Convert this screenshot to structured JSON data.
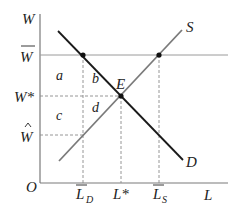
{
  "diagram": {
    "axes": {
      "y_label": "W",
      "x_label": "L",
      "origin_label": "O"
    },
    "y_ticks": [
      {
        "label": "W",
        "overline": true,
        "hat": false,
        "star": false,
        "y": 55
      },
      {
        "label": "W*",
        "overline": false,
        "hat": false,
        "star": true,
        "y": 96
      },
      {
        "label": "W",
        "overline": false,
        "hat": true,
        "star": false,
        "y": 135
      }
    ],
    "x_ticks": [
      {
        "label": "L",
        "sub": "D",
        "overline": true,
        "x": 83
      },
      {
        "label": "L*",
        "sub": "",
        "overline": false,
        "x": 121
      },
      {
        "label": "L",
        "sub": "S",
        "overline": true,
        "x": 159
      }
    ],
    "curves": {
      "demand": {
        "label": "D",
        "color": "#1a1a1a"
      },
      "supply": {
        "label": "S",
        "color": "#7a7a7a"
      }
    },
    "equilibrium_label": "E",
    "regions": [
      "a",
      "b",
      "c",
      "d"
    ],
    "colors": {
      "axis": "#7a7a7a",
      "demand": "#1a1a1a",
      "supply": "#7a7a7a",
      "dashed": "#8a8a8a",
      "price_floor_line": "#9a9a9a",
      "dot": "#111111"
    }
  }
}
